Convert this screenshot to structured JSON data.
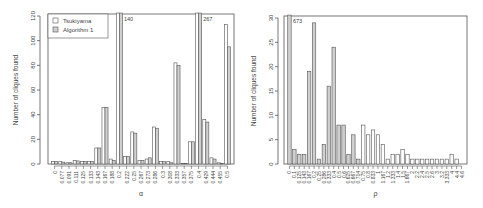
{
  "chart_data": [
    {
      "type": "bar",
      "title": "",
      "xlabel": "α",
      "ylabel": "Number of cliques found",
      "ylim": [
        0,
        120
      ],
      "yticks": [
        0,
        20,
        40,
        60,
        80,
        100,
        120
      ],
      "legend": {
        "position": "top-left",
        "entries": [
          "Tsukiyama",
          "Algorithm 1"
        ]
      },
      "categories": [
        "0",
        "0.077",
        "0.091",
        "0.111",
        "0.125",
        "0.133",
        "0.143",
        "0.167",
        "0.188",
        "0.2",
        "0.222",
        "0.25",
        "0.267",
        "0.273",
        "0.286",
        "0.3",
        "0.308",
        "0.333",
        "0.357",
        "0.375",
        "0.4",
        "0.429",
        "0.444",
        "0.455",
        "0.5"
      ],
      "series": [
        {
          "name": "Tsukiyama",
          "color": "#ffffff",
          "values": [
            2,
            2,
            1,
            3,
            2,
            2,
            13,
            46,
            4,
            140,
            6,
            26,
            3,
            4,
            30,
            2,
            2,
            82,
            0.5,
            18,
            267,
            36,
            5,
            1,
            113
          ]
        },
        {
          "name": "Algorithm 1",
          "color": "#cfcfcf",
          "values": [
            2,
            1.5,
            1,
            2.5,
            2,
            2,
            13,
            46,
            3,
            140,
            6,
            25,
            3,
            5,
            29,
            2,
            1,
            80,
            0.5,
            18,
            267,
            34,
            4,
            0.5,
            95
          ]
        }
      ],
      "annotations": [
        {
          "category": "0.2",
          "text": "140"
        },
        {
          "category": "0.4",
          "text": "267"
        }
      ],
      "grid": false
    },
    {
      "type": "bar",
      "title": "",
      "xlabel": "ρ",
      "ylabel": "Number of cliques found",
      "ylim": [
        0,
        30
      ],
      "yticks": [
        0,
        5,
        10,
        15,
        20,
        25,
        30
      ],
      "categories": [
        "0",
        "0.1",
        "0.125",
        "0.143",
        "0.167",
        "0.2",
        "0.25",
        "0.286",
        "0.333",
        "0.4",
        "0.5",
        "0.6",
        "0.625",
        "0.667",
        "0.714",
        "0.75",
        "0.8",
        "0.833",
        "1",
        "1.167",
        "1.2",
        "1.333",
        "1.4",
        "1.5",
        "1.667",
        "2",
        "2.2",
        "2.4",
        "2.5",
        "2.6",
        "3",
        "3.2",
        "3.333",
        "4",
        "4.4",
        "4.6"
      ],
      "series": [
        {
          "name": "cliques",
          "values": [
            673,
            3,
            2,
            2,
            19,
            29,
            1,
            4,
            16,
            24,
            8,
            8,
            2,
            6,
            1,
            8,
            6,
            7,
            6,
            4,
            1,
            2,
            2,
            3,
            2,
            1,
            1,
            1,
            1,
            1,
            1,
            1,
            1,
            2,
            1,
            0
          ],
          "filled_until_index": 14,
          "fill_color": "#cfcfcf",
          "empty_color": "#ffffff"
        }
      ],
      "annotations": [
        {
          "category": "0",
          "text": "673"
        }
      ],
      "grid": false
    }
  ]
}
